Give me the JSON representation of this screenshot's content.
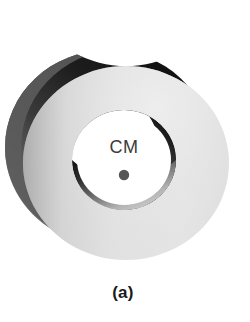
{
  "figure": {
    "caption": "(a)",
    "center_of_mass_label": "CM",
    "background_color": "#ffffff"
  },
  "diagram": {
    "type": "physics-rigid-body-illustration",
    "parts": [
      {
        "name": "back-rim",
        "label": "",
        "fill_light": "#cfcfcf",
        "fill_dark": "#1d1d1d"
      },
      {
        "name": "inner-wall",
        "label": "",
        "fill_light": "#f2f2f2",
        "fill_dark": "#141414"
      },
      {
        "name": "front-face",
        "label": "",
        "fill_light": "#e8e8e8",
        "fill_dark": "#9a9a9a"
      },
      {
        "name": "bore-hole",
        "label": "",
        "fill_light": "#ffffff",
        "fill_dark": "#ffffff"
      },
      {
        "name": "center-of-mass-dot",
        "label": "CM",
        "fill_light": "#555555",
        "fill_dark": "#555555"
      }
    ],
    "colors": {
      "light_gray": "#e2e2e2",
      "mid_gray": "#a8a8a8",
      "dark_gray": "#3b3b3b",
      "near_black": "#141414",
      "white": "#ffffff",
      "dot_color": "#555555",
      "text_color": "#3b3b3b",
      "caption_color": "#1a1a1a"
    },
    "geometry": {
      "front_face_center_x": 126,
      "front_face_center_y": 163,
      "front_face_rx": 103,
      "front_face_ry": 97,
      "bore_center_x": 124,
      "bore_center_y": 160,
      "bore_rx": 52,
      "bore_ry": 50,
      "cm_dot_x": 124,
      "cm_dot_y": 175,
      "cm_dot_r": 5,
      "depth_offset_x": -18,
      "depth_offset_y": -16
    }
  }
}
